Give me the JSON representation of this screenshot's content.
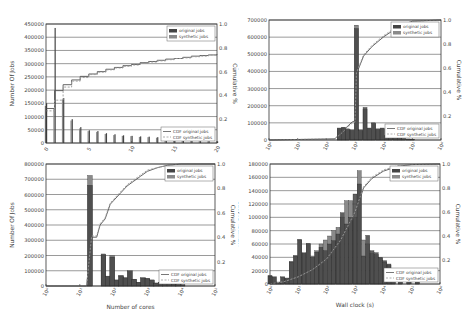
{
  "colors": {
    "original": "#444444",
    "synthetic": "#8a8a8a",
    "cdf_original": "#555555",
    "cdf_synthetic": "#9a9a9a",
    "grid": "#555555",
    "frame": "#333333"
  },
  "chart_data": [
    {
      "id": "interarrival",
      "type": "bar",
      "title": "",
      "xlabel": "Inter-arrival time(s)",
      "ylabel": "Number Of Jobs",
      "ylabel_right": "Cumulative %",
      "xscale": "linear",
      "xlim": [
        0,
        20
      ],
      "ylim": [
        0,
        450000
      ],
      "ylim_right": [
        0,
        1.0
      ],
      "xticks": [
        "0",
        "5",
        "10",
        "15",
        "20"
      ],
      "yticks": [
        "0",
        "50000",
        "100000",
        "150000",
        "200000",
        "250000",
        "300000",
        "350000",
        "400000",
        "450000"
      ],
      "yticks_right": [
        "0.2",
        "0.4",
        "0.6",
        "0.8",
        "1.0"
      ],
      "grid": true,
      "legend_top": [
        "original jobs",
        "synthetic jobs"
      ],
      "legend_bottom": [
        "CDF original jobs",
        "CDF synthetic jobs"
      ],
      "legend_position": "upper right / lower right",
      "x": [
        0,
        1,
        2,
        3,
        4,
        5,
        6,
        7,
        8,
        9,
        10,
        11,
        12,
        13,
        14,
        15,
        16,
        17,
        18,
        19,
        20
      ],
      "series": [
        {
          "name": "original jobs",
          "values": [
            150000,
            435000,
            170000,
            90000,
            60000,
            48000,
            45000,
            37000,
            33000,
            29000,
            27000,
            25000,
            24000,
            22000,
            10000,
            9000,
            8000,
            8000,
            7000,
            7000,
            6000
          ]
        },
        {
          "name": "synthetic jobs",
          "values": [
            140000,
            130000,
            165000,
            85000,
            55000,
            45000,
            42000,
            34000,
            30000,
            27000,
            26000,
            23000,
            22000,
            20000,
            9000,
            8000,
            8000,
            7000,
            7000,
            6000,
            6000
          ]
        },
        {
          "name": "CDF original jobs",
          "axis": "right",
          "values": [
            0.29,
            0.44,
            0.49,
            0.53,
            0.56,
            0.58,
            0.6,
            0.62,
            0.635,
            0.65,
            0.66,
            0.675,
            0.685,
            0.695,
            0.705,
            0.71,
            0.72,
            0.73,
            0.735,
            0.74,
            0.745
          ]
        },
        {
          "name": "CDF synthetic jobs",
          "axis": "right",
          "values": [
            0.27,
            0.36,
            0.47,
            0.52,
            0.55,
            0.575,
            0.595,
            0.615,
            0.63,
            0.645,
            0.655,
            0.67,
            0.68,
            0.69,
            0.7,
            0.71,
            0.715,
            0.725,
            0.73,
            0.74,
            0.745
          ]
        }
      ]
    },
    {
      "id": "walllimit",
      "type": "bar",
      "title": "",
      "xlabel": "Wall clock limit(s)",
      "ylabel": "Number Of Jobs",
      "ylabel_right": "Cumulative %",
      "xscale": "log",
      "xlim": [
        0,
        6
      ],
      "ylim": [
        0,
        700000
      ],
      "ylim_right": [
        0,
        1.0
      ],
      "xticks": [
        "10^0",
        "10^1",
        "10^2",
        "10^3",
        "10^4",
        "10^5",
        "10^6"
      ],
      "yticks": [
        "0",
        "100000",
        "200000",
        "300000",
        "400000",
        "500000",
        "600000",
        "700000"
      ],
      "yticks_right": [
        "0.2",
        "0.4",
        "0.6",
        "0.8",
        "1.0"
      ],
      "grid": true,
      "legend_top": [
        "original jobs",
        "synthetic jobs"
      ],
      "legend_bottom": [
        "CDF original jobs",
        "CDF synthetic jobs"
      ],
      "x_log10": [
        2.45,
        2.6,
        2.75,
        2.9,
        3.05,
        3.2,
        3.35,
        3.5,
        3.65,
        3.8,
        3.95,
        4.1,
        4.25,
        4.4,
        4.55,
        4.7,
        4.85,
        5.0
      ],
      "series": [
        {
          "name": "original jobs",
          "values": [
            70000,
            75000,
            65000,
            60000,
            650000,
            60000,
            190000,
            70000,
            100000,
            65000,
            70000,
            25000,
            20000,
            15000,
            10000,
            8000,
            6000,
            5000
          ]
        },
        {
          "name": "synthetic jobs",
          "values": [
            65000,
            70000,
            60000,
            55000,
            670000,
            55000,
            180000,
            65000,
            95000,
            60000,
            65000,
            22000,
            18000,
            14000,
            9000,
            7000,
            5000,
            4000
          ]
        },
        {
          "name": "CDF original jobs",
          "axis": "right",
          "x_log10": [
            0,
            2.3,
            2.5,
            2.9,
            3.0,
            3.05,
            3.3,
            3.6,
            4.0,
            4.5,
            5.0,
            6.0
          ],
          "values": [
            0,
            0.01,
            0.06,
            0.15,
            0.16,
            0.55,
            0.7,
            0.78,
            0.86,
            0.94,
            0.99,
            1.0
          ]
        },
        {
          "name": "CDF synthetic jobs",
          "axis": "right",
          "x_log10": [
            0,
            2.3,
            2.5,
            2.9,
            3.0,
            3.05,
            3.3,
            3.6,
            4.0,
            4.5,
            5.0,
            6.0
          ],
          "values": [
            0,
            0.01,
            0.05,
            0.14,
            0.15,
            0.56,
            0.71,
            0.79,
            0.87,
            0.95,
            0.99,
            1.0
          ]
        }
      ]
    },
    {
      "id": "cores",
      "type": "bar",
      "title": "",
      "xlabel": "Number of cores",
      "ylabel": "Number Of Jobs",
      "ylabel_right": "Cumulative %",
      "xscale": "log",
      "xlim": [
        0,
        5
      ],
      "ylim": [
        0,
        800000
      ],
      "ylim_right": [
        0,
        1.0
      ],
      "xticks": [
        "10^0",
        "10^1",
        "10^2",
        "10^3",
        "10^4",
        "10^5"
      ],
      "yticks": [
        "0",
        "100000",
        "200000",
        "300000",
        "400000",
        "500000",
        "600000",
        "700000",
        "800000"
      ],
      "yticks_right": [
        "0.2",
        "0.4",
        "0.6",
        "0.8",
        "1.0"
      ],
      "grid": true,
      "legend_top": [
        "original jobs",
        "synthetic jobs"
      ],
      "legend_bottom": [
        "CDF original jobs",
        "CDF synthetic jobs"
      ],
      "x_log10": [
        1.3,
        1.7,
        1.83,
        1.96,
        2.09,
        2.22,
        2.35,
        2.48,
        2.61,
        2.74,
        2.87,
        3.0,
        3.13,
        3.26,
        3.39,
        3.52,
        3.65,
        3.78,
        3.91,
        4.04
      ],
      "series": [
        {
          "name": "original jobs",
          "values": [
            660000,
            210000,
            65000,
            190000,
            40000,
            70000,
            55000,
            100000,
            45000,
            25000,
            55000,
            50000,
            40000,
            20000,
            25000,
            20000,
            18000,
            12000,
            10000,
            8000
          ]
        },
        {
          "name": "synthetic jobs",
          "values": [
            725000,
            200000,
            60000,
            200000,
            38000,
            65000,
            52000,
            95000,
            42000,
            23000,
            52000,
            48000,
            38000,
            18000,
            24000,
            18000,
            16000,
            11000,
            9000,
            7000
          ]
        },
        {
          "name": "CDF original jobs",
          "axis": "right",
          "x_log10": [
            0,
            1.2,
            1.35,
            1.5,
            1.6,
            1.75,
            1.9,
            2.0,
            2.2,
            2.4,
            2.6,
            2.8,
            3.0,
            3.3,
            3.6,
            4.0,
            5.0
          ],
          "values": [
            0,
            0,
            0.4,
            0.4,
            0.5,
            0.55,
            0.67,
            0.7,
            0.76,
            0.82,
            0.86,
            0.9,
            0.94,
            0.97,
            0.99,
            1.0,
            1.0
          ]
        },
        {
          "name": "CDF synthetic jobs",
          "axis": "right",
          "x_log10": [
            0,
            1.2,
            1.35,
            1.5,
            1.6,
            1.75,
            1.9,
            2.0,
            2.2,
            2.4,
            2.6,
            2.8,
            3.0,
            3.3,
            3.6,
            4.0,
            5.0
          ],
          "values": [
            0,
            0,
            0.41,
            0.41,
            0.51,
            0.56,
            0.68,
            0.71,
            0.77,
            0.83,
            0.87,
            0.91,
            0.95,
            0.97,
            0.99,
            1.0,
            1.0
          ]
        }
      ]
    },
    {
      "id": "wallclock",
      "type": "bar",
      "title": "",
      "xlabel": "Wall clock (s)",
      "ylabel": "Number Of Jobs",
      "ylabel_right": "Cumulative %",
      "xscale": "log",
      "xlim": [
        0,
        6
      ],
      "ylim": [
        0,
        180000
      ],
      "ylim_right": [
        0,
        1.0
      ],
      "xticks": [
        "10^0",
        "10^1",
        "10^2",
        "10^3",
        "10^4",
        "10^5",
        "10^6"
      ],
      "yticks": [
        "0",
        "20000",
        "40000",
        "60000",
        "80000",
        "100000",
        "120000",
        "140000",
        "160000",
        "180000"
      ],
      "yticks_right": [
        "0.2",
        "0.4",
        "0.6",
        "0.8",
        "1.0"
      ],
      "grid": true,
      "legend_top": [
        "original jobs",
        "synthetic jobs"
      ],
      "legend_bottom": [
        "CDF original jobs",
        "CDF synthetic jobs"
      ],
      "x_log10": [
        0.0,
        0.15,
        0.3,
        0.45,
        0.6,
        0.75,
        0.9,
        1.05,
        1.2,
        1.35,
        1.5,
        1.65,
        1.8,
        1.95,
        2.1,
        2.25,
        2.4,
        2.55,
        2.7,
        2.85,
        3.0,
        3.15,
        3.3,
        3.45,
        3.6,
        3.75,
        3.9,
        4.05,
        4.2,
        4.35,
        4.6,
        4.9,
        5.2
      ],
      "series": [
        {
          "name": "original jobs",
          "values": [
            12000,
            10000,
            2000,
            10000,
            8000,
            33000,
            42000,
            67000,
            46000,
            61000,
            40000,
            48000,
            55000,
            50000,
            60000,
            65000,
            75000,
            107000,
            90000,
            100000,
            135000,
            150000,
            42000,
            73000,
            50000,
            47000,
            40000,
            35000,
            30000,
            15000,
            10000,
            5000,
            3000
          ]
        },
        {
          "name": "synthetic jobs",
          "values": [
            13000,
            11000,
            3000,
            11000,
            9000,
            34000,
            43000,
            66000,
            47000,
            60000,
            42000,
            50000,
            60000,
            66000,
            72000,
            80000,
            85000,
            100000,
            125000,
            125000,
            100000,
            170000,
            66000,
            60000,
            46000,
            44000,
            39000,
            33000,
            28000,
            14000,
            9000,
            4000,
            2000
          ]
        },
        {
          "name": "CDF original jobs",
          "axis": "right",
          "x_log10": [
            0,
            0.5,
            1.0,
            1.5,
            2.0,
            2.5,
            3.0,
            3.3,
            3.6,
            4.0,
            4.5,
            5.0,
            6.0
          ],
          "values": [
            0,
            0.02,
            0.06,
            0.12,
            0.2,
            0.36,
            0.58,
            0.8,
            0.88,
            0.94,
            0.98,
            0.995,
            1.0
          ]
        },
        {
          "name": "CDF synthetic jobs",
          "axis": "right",
          "x_log10": [
            0,
            0.5,
            1.0,
            1.5,
            2.0,
            2.5,
            3.0,
            3.3,
            3.6,
            4.0,
            4.5,
            5.0,
            6.0
          ],
          "values": [
            0,
            0.02,
            0.06,
            0.12,
            0.21,
            0.37,
            0.6,
            0.81,
            0.89,
            0.95,
            0.985,
            0.995,
            1.0
          ]
        }
      ]
    }
  ]
}
